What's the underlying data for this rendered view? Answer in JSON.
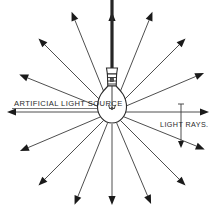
{
  "diagram": {
    "title": "Artificial Light Source",
    "canvas": {
      "width": 214,
      "height": 213,
      "background": "#ffffff"
    },
    "colors": {
      "ink": "#2b2b2b",
      "ray": "#3a3a3a",
      "arrowhead": "#1a1a1a",
      "cord": "#262626",
      "background": "#ffffff"
    },
    "labels": {
      "left": {
        "text": "ARTIFICIAL LIGHT SOURCE",
        "x": 14,
        "y": 106,
        "anchor": "start"
      },
      "right": {
        "text": "LIGHT RAYS.",
        "x": 160,
        "y": 127,
        "anchor": "start"
      }
    },
    "source": {
      "name": "incandescent-light-bulb",
      "center_x": 112,
      "center_y": 112,
      "bulb_radius": 15,
      "cord_top_y": 0,
      "socket_top_y": 66
    },
    "leader": {
      "name": "light-rays-leader",
      "x": 181,
      "top_y": 104,
      "bottom_y": 148,
      "tick_half_width": 3
    },
    "rays": [
      {
        "id": "ray-n",
        "angle_deg": 270,
        "length": 100,
        "label": "up"
      },
      {
        "id": "ray-nne",
        "angle_deg": 292,
        "length": 108,
        "label": "up-right-steep"
      },
      {
        "id": "ray-ne",
        "angle_deg": 315,
        "length": 104,
        "label": "up-right"
      },
      {
        "id": "ray-ene",
        "angle_deg": 337,
        "length": 100,
        "label": "right-up-shallow"
      },
      {
        "id": "ray-e",
        "angle_deg": 0,
        "length": 97,
        "label": "right"
      },
      {
        "id": "ray-ese",
        "angle_deg": 22,
        "length": 100,
        "label": "right-down-shallow"
      },
      {
        "id": "ray-se",
        "angle_deg": 45,
        "length": 104,
        "label": "down-right"
      },
      {
        "id": "ray-sse",
        "angle_deg": 67,
        "length": 100,
        "label": "down-right-steep"
      },
      {
        "id": "ray-s",
        "angle_deg": 90,
        "length": 93,
        "label": "down"
      },
      {
        "id": "ray-ssw",
        "angle_deg": 112,
        "length": 100,
        "label": "down-left-steep"
      },
      {
        "id": "ray-sw",
        "angle_deg": 135,
        "length": 104,
        "label": "down-left"
      },
      {
        "id": "ray-wsw",
        "angle_deg": 157,
        "length": 100,
        "label": "left-down-shallow"
      },
      {
        "id": "ray-w",
        "angle_deg": 180,
        "length": 105,
        "label": "left"
      },
      {
        "id": "ray-wnw",
        "angle_deg": 202,
        "length": 100,
        "label": "left-up-shallow"
      },
      {
        "id": "ray-nw",
        "angle_deg": 225,
        "length": 104,
        "label": "up-left"
      },
      {
        "id": "ray-nnw",
        "angle_deg": 248,
        "length": 108,
        "label": "up-left-steep"
      }
    ]
  }
}
